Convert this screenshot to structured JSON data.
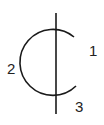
{
  "diagram": {
    "type": "schematic-symbol",
    "stroke_color": "#1a1a1a",
    "label_color": "#222222",
    "pins": [
      {
        "id": "1",
        "label": "1"
      },
      {
        "id": "2",
        "label": "2"
      },
      {
        "id": "3",
        "label": "3"
      }
    ]
  }
}
